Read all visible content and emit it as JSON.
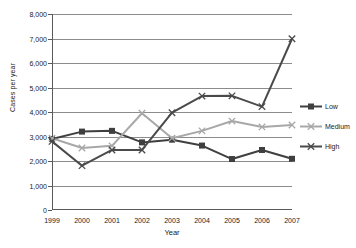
{
  "chart_data": {
    "type": "line",
    "title": "",
    "xlabel": "Year",
    "ylabel": "Cases per year",
    "categories": [
      "1999",
      "2000",
      "2001",
      "2002",
      "2003",
      "2004",
      "2005",
      "2006",
      "2007"
    ],
    "x": [
      1999,
      2000,
      2001,
      2002,
      2003,
      2004,
      2005,
      2006,
      2007
    ],
    "ylim": [
      0,
      8000
    ],
    "xlim": [
      1999,
      2007
    ],
    "yticks": [
      0,
      1000,
      2000,
      3000,
      4000,
      5000,
      6000,
      7000,
      8000
    ],
    "ytick_labels": [
      "0",
      "1,000",
      "2,000",
      "3,000",
      "4,000",
      "5,000",
      "6,000",
      "7,000",
      "8,000"
    ],
    "grid": true,
    "grid_axis": "y",
    "legend_position": "right",
    "series": [
      {
        "name": "Low",
        "color": "#3f3f3f",
        "marker": "square",
        "values": [
          2900,
          3200,
          3230,
          2760,
          2870,
          2630,
          2080,
          2450,
          2090
        ]
      },
      {
        "name": "Medium",
        "color": "#a8a8a8",
        "marker": "x",
        "values": [
          2930,
          2530,
          2620,
          3950,
          2930,
          3230,
          3630,
          3390,
          3470
        ]
      },
      {
        "name": "High",
        "color": "#4a4a4a",
        "marker": "x",
        "values": [
          2800,
          1810,
          2450,
          2450,
          3970,
          4650,
          4660,
          4220,
          6990
        ]
      }
    ]
  },
  "legend": {
    "items": [
      {
        "label": "Low"
      },
      {
        "label": "Medium"
      },
      {
        "label": "High"
      }
    ]
  },
  "axes": {
    "y_title": "Cases per year",
    "x_title": "Year"
  }
}
